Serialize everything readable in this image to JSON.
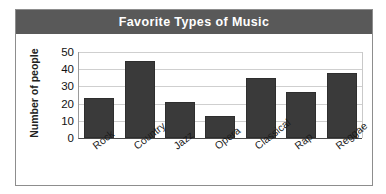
{
  "chart_data": {
    "type": "bar",
    "title": "Favorite Types of Music",
    "xlabel": "",
    "ylabel": "Number of people",
    "categories": [
      "Rock",
      "Country",
      "Jazz",
      "Opera",
      "Classical",
      "Rap",
      "Reggae"
    ],
    "values": [
      23,
      45,
      21,
      13,
      35,
      27,
      38
    ],
    "ylim": [
      0,
      50
    ],
    "yticks": [
      0,
      10,
      20,
      30,
      40,
      50
    ],
    "grid": true,
    "legend": "none",
    "series": [
      {
        "name": "Number of people",
        "values": [
          23,
          45,
          21,
          13,
          35,
          27,
          38
        ]
      }
    ]
  },
  "style": {
    "title_band_color": "#595959",
    "title_text_color": "#ffffff",
    "bar_color": "#3a3a3a",
    "gridline_color": "#cfcfcf",
    "frame_color": "#8d8d8d",
    "background": "#ffffff"
  }
}
